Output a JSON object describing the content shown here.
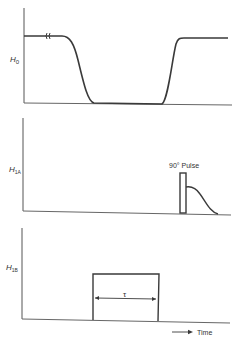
{
  "panels": [
    {
      "id": "h0",
      "label_main": "H",
      "label_sub": "0"
    },
    {
      "id": "h1a",
      "label_main": "H",
      "label_sub": "1A",
      "annotation": "90° Pulse"
    },
    {
      "id": "h1b",
      "label_main": "H",
      "label_sub": "1B",
      "interval_label": "τ"
    }
  ],
  "time_axis": {
    "label": "Time"
  },
  "colors": {
    "line": "#3a3a3a",
    "axis": "#555555"
  }
}
